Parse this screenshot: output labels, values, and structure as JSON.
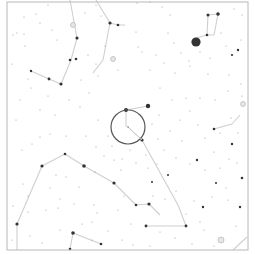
{
  "map": {
    "type": "star-chart",
    "frame": {
      "x1": 7,
      "y1": 2,
      "x2": 248,
      "y2": 250,
      "color": "#b8b8b8"
    },
    "colors": {
      "background": "#ffffff",
      "line": "#cfcfcf",
      "star": "#333333",
      "faint_star": "#9a9a9a",
      "target": "#555555"
    },
    "target": {
      "cx": 128,
      "cy": 127,
      "r": 17
    },
    "target_pointer": {
      "x1": 128,
      "y1": 127,
      "x2": 142,
      "y2": 140
    },
    "bright_stars": [
      {
        "x": 196,
        "y": 42,
        "r": 4.6
      },
      {
        "x": 148,
        "y": 106,
        "r": 2.2
      },
      {
        "x": 126,
        "y": 110,
        "r": 2.0
      },
      {
        "x": 142,
        "y": 140,
        "r": 1.6
      },
      {
        "x": 110,
        "y": 23,
        "r": 1.6
      },
      {
        "x": 77,
        "y": 38,
        "r": 1.6
      },
      {
        "x": 61,
        "y": 84,
        "r": 1.6
      },
      {
        "x": 76,
        "y": 59,
        "r": 1.3
      },
      {
        "x": 70,
        "y": 60,
        "r": 1.3
      },
      {
        "x": 49,
        "y": 79,
        "r": 1.4
      },
      {
        "x": 31,
        "y": 71,
        "r": 1.2
      },
      {
        "x": 218,
        "y": 14,
        "r": 1.8
      },
      {
        "x": 208,
        "y": 15,
        "r": 1.5
      },
      {
        "x": 207,
        "y": 35,
        "r": 1.3
      },
      {
        "x": 118,
        "y": 25,
        "r": 1.3
      },
      {
        "x": 42,
        "y": 166,
        "r": 1.6
      },
      {
        "x": 65,
        "y": 154,
        "r": 1.3
      },
      {
        "x": 84,
        "y": 166,
        "r": 1.8
      },
      {
        "x": 114,
        "y": 183,
        "r": 1.6
      },
      {
        "x": 136,
        "y": 205,
        "r": 1.3
      },
      {
        "x": 149,
        "y": 204,
        "r": 1.6
      },
      {
        "x": 146,
        "y": 226,
        "r": 1.4
      },
      {
        "x": 186,
        "y": 226,
        "r": 1.4
      },
      {
        "x": 17,
        "y": 224,
        "r": 1.6
      },
      {
        "x": 73,
        "y": 233,
        "r": 1.8
      },
      {
        "x": 101,
        "y": 244,
        "r": 1.3
      },
      {
        "x": 70,
        "y": 249,
        "r": 1.3
      },
      {
        "x": 242,
        "y": 178,
        "r": 1.3
      },
      {
        "x": 214,
        "y": 129,
        "r": 1.3
      },
      {
        "x": 232,
        "y": 144,
        "r": 1.2
      },
      {
        "x": 203,
        "y": 207,
        "r": 1.2
      },
      {
        "x": 240,
        "y": 207,
        "r": 1.2
      },
      {
        "x": 197,
        "y": 160,
        "r": 1.2
      },
      {
        "x": 238,
        "y": 50,
        "r": 1.2
      },
      {
        "x": 232,
        "y": 55,
        "r": 1.1
      },
      {
        "x": 216,
        "y": 183,
        "r": 1.0
      },
      {
        "x": 152,
        "y": 182,
        "r": 1.0
      },
      {
        "x": 168,
        "y": 175,
        "r": 1.0
      }
    ],
    "faint_rings": [
      {
        "x": 73,
        "y": 25,
        "r": 2.5
      },
      {
        "x": 113,
        "y": 59,
        "r": 2.5
      },
      {
        "x": 221,
        "y": 240,
        "r": 3
      },
      {
        "x": 243,
        "y": 104,
        "r": 2.5
      }
    ],
    "constellation_lines": [
      [
        [
          70,
          0
        ],
        [
          77,
          38
        ],
        [
          71,
          60
        ],
        [
          61,
          84
        ]
      ],
      [
        [
          61,
          84
        ],
        [
          49,
          79
        ],
        [
          31,
          71
        ]
      ],
      [
        [
          96,
          0
        ],
        [
          110,
          23
        ],
        [
          118,
          25
        ],
        [
          125,
          25
        ]
      ],
      [
        [
          110,
          23
        ],
        [
          103,
          60
        ],
        [
          93,
          73
        ]
      ],
      [
        [
          218,
          14
        ],
        [
          208,
          15
        ],
        [
          207,
          35
        ],
        [
          196,
          38
        ]
      ],
      [
        [
          218,
          14
        ],
        [
          214,
          35
        ],
        [
          207,
          35
        ]
      ],
      [
        [
          126,
          110
        ],
        [
          148,
          106
        ]
      ],
      [
        [
          126,
          110
        ],
        [
          126,
          127
        ]
      ],
      [
        [
          142,
          140
        ],
        [
          178,
          205
        ],
        [
          186,
          226
        ]
      ],
      [
        [
          146,
          226
        ],
        [
          186,
          226
        ]
      ],
      [
        [
          17,
          250
        ],
        [
          17,
          224
        ],
        [
          42,
          166
        ],
        [
          65,
          154
        ],
        [
          84,
          166
        ],
        [
          114,
          183
        ],
        [
          136,
          205
        ],
        [
          149,
          204
        ],
        [
          160,
          215
        ]
      ],
      [
        [
          70,
          249
        ],
        [
          73,
          233
        ],
        [
          101,
          244
        ]
      ],
      [
        [
          214,
          129
        ],
        [
          232,
          124
        ],
        [
          240,
          115
        ]
      ],
      [
        [
          233,
          250
        ],
        [
          247,
          237
        ]
      ]
    ],
    "faint_stars": [
      [
        24,
        17
      ],
      [
        36,
        14
      ],
      [
        48,
        5
      ],
      [
        40,
        23
      ],
      [
        52,
        30
      ],
      [
        57,
        40
      ],
      [
        24,
        34
      ],
      [
        17,
        33
      ],
      [
        13,
        35
      ],
      [
        25,
        46
      ],
      [
        12,
        64
      ],
      [
        28,
        79
      ],
      [
        48,
        96
      ],
      [
        20,
        100
      ],
      [
        31,
        88
      ],
      [
        85,
        13
      ],
      [
        96,
        5
      ],
      [
        101,
        16
      ],
      [
        105,
        46
      ],
      [
        88,
        55
      ],
      [
        96,
        64
      ],
      [
        81,
        80
      ],
      [
        89,
        93
      ],
      [
        69,
        100
      ],
      [
        40,
        110
      ],
      [
        16,
        120
      ],
      [
        55,
        115
      ],
      [
        80,
        107
      ],
      [
        98,
        76
      ],
      [
        118,
        70
      ],
      [
        137,
        3
      ],
      [
        150,
        2
      ],
      [
        162,
        7
      ],
      [
        170,
        15
      ],
      [
        168,
        33
      ],
      [
        174,
        43
      ],
      [
        181,
        53
      ],
      [
        189,
        61
      ],
      [
        200,
        52
      ],
      [
        210,
        58
      ],
      [
        221,
        33
      ],
      [
        226,
        46
      ],
      [
        241,
        40
      ],
      [
        242,
        15
      ],
      [
        234,
        9
      ],
      [
        150,
        70
      ],
      [
        156,
        55
      ],
      [
        142,
        52
      ],
      [
        136,
        32
      ],
      [
        138,
        47
      ],
      [
        164,
        63
      ],
      [
        175,
        73
      ],
      [
        190,
        66
      ],
      [
        208,
        74
      ],
      [
        229,
        75
      ],
      [
        241,
        84
      ],
      [
        228,
        91
      ],
      [
        215,
        100
      ],
      [
        200,
        98
      ],
      [
        186,
        98
      ],
      [
        160,
        88
      ],
      [
        172,
        100
      ],
      [
        190,
        111
      ],
      [
        180,
        120
      ],
      [
        159,
        115
      ],
      [
        198,
        125
      ],
      [
        205,
        138
      ],
      [
        220,
        133
      ],
      [
        231,
        118
      ],
      [
        238,
        133
      ],
      [
        242,
        96
      ],
      [
        152,
        124
      ],
      [
        170,
        131
      ],
      [
        182,
        141
      ],
      [
        214,
        152
      ],
      [
        229,
        159
      ],
      [
        237,
        163
      ],
      [
        190,
        164
      ],
      [
        205,
        170
      ],
      [
        220,
        168
      ],
      [
        176,
        158
      ],
      [
        164,
        150
      ],
      [
        157,
        164
      ],
      [
        148,
        168
      ],
      [
        226,
        188
      ],
      [
        212,
        197
      ],
      [
        228,
        200
      ],
      [
        194,
        201
      ],
      [
        204,
        230
      ],
      [
        236,
        226
      ],
      [
        160,
        232
      ],
      [
        175,
        238
      ],
      [
        192,
        244
      ],
      [
        214,
        246
      ],
      [
        150,
        246
      ],
      [
        133,
        245
      ],
      [
        122,
        240
      ],
      [
        108,
        231
      ],
      [
        92,
        240
      ],
      [
        82,
        224
      ],
      [
        60,
        230
      ],
      [
        42,
        243
      ],
      [
        30,
        236
      ],
      [
        28,
        212
      ],
      [
        46,
        210
      ],
      [
        58,
        208
      ],
      [
        60,
        199
      ],
      [
        74,
        204
      ],
      [
        94,
        205
      ],
      [
        97,
        213
      ],
      [
        79,
        187
      ],
      [
        50,
        188
      ],
      [
        23,
        184
      ],
      [
        22,
        150
      ],
      [
        32,
        144
      ],
      [
        40,
        137
      ],
      [
        50,
        134
      ],
      [
        66,
        136
      ],
      [
        86,
        136
      ],
      [
        96,
        147
      ],
      [
        104,
        156
      ],
      [
        114,
        160
      ],
      [
        121,
        170
      ],
      [
        108,
        136
      ],
      [
        98,
        120
      ],
      [
        112,
        146
      ],
      [
        95,
        172
      ],
      [
        124,
        196
      ],
      [
        118,
        210
      ],
      [
        131,
        224
      ],
      [
        92,
        222
      ],
      [
        66,
        177
      ],
      [
        56,
        175
      ],
      [
        28,
        196
      ],
      [
        13,
        206
      ],
      [
        12,
        240
      ],
      [
        165,
        199
      ],
      [
        176,
        191
      ],
      [
        186,
        214
      ],
      [
        200,
        222
      ],
      [
        158,
        139
      ],
      [
        146,
        155
      ],
      [
        130,
        150
      ],
      [
        122,
        159
      ],
      [
        136,
        163
      ],
      [
        153,
        196
      ]
    ]
  }
}
